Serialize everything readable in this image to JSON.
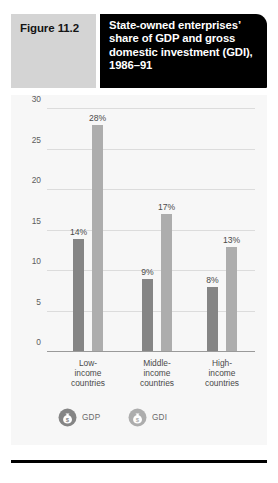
{
  "header": {
    "figure_number": "Figure 11.2",
    "title": "State-owned enterprises’ share of GDP and gross domestic investment (GDI), 1986–91"
  },
  "legend": {
    "items": [
      {
        "label": "GDP",
        "icon": "money-bag-icon",
        "color": "#858585"
      },
      {
        "label": "GDI",
        "icon": "money-bag-icon",
        "color": "#adadad"
      }
    ]
  },
  "chart_data": {
    "type": "bar",
    "title": "State-owned enterprises’ share of GDP and gross domestic investment (GDI), 1986–91",
    "xlabel": "",
    "ylabel": "",
    "ylim": [
      0,
      30
    ],
    "yticks": [
      0,
      5,
      10,
      15,
      20,
      25,
      30
    ],
    "ytick_labels": [
      "0",
      "5",
      "10",
      "15",
      "20",
      "25",
      "30"
    ],
    "grid": true,
    "legend_position": "bottom-left",
    "categories": [
      "Low-income countries",
      "Middle-income countries",
      "High-income countries"
    ],
    "category_lines": [
      [
        "Low-",
        "income",
        "countries"
      ],
      [
        "Middle-",
        "income",
        "countries"
      ],
      [
        "High-",
        "income",
        "countries"
      ]
    ],
    "series": [
      {
        "name": "GDP",
        "color": "#858585",
        "values": [
          14,
          9,
          8
        ],
        "data_labels": [
          "14%",
          "9%",
          "8%"
        ]
      },
      {
        "name": "GDI",
        "color": "#adadad",
        "values": [
          28,
          17,
          13
        ],
        "data_labels": [
          "28%",
          "17%",
          "13%"
        ]
      }
    ]
  }
}
